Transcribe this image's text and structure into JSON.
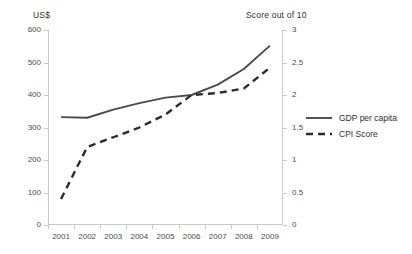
{
  "chart_data": {
    "type": "line",
    "title": "",
    "xlabel": "",
    "categories": [
      "2001",
      "2002",
      "2003",
      "2004",
      "2005",
      "2006",
      "2007",
      "2008",
      "2009"
    ],
    "axes": {
      "left": {
        "label": "US$",
        "ticks": [
          "0",
          "100",
          "200",
          "300",
          "400",
          "500",
          "600"
        ],
        "tick_values": [
          0,
          100,
          200,
          300,
          400,
          500,
          600
        ],
        "range": [
          0,
          600
        ]
      },
      "right": {
        "label": "Score out of 10",
        "ticks": [
          "0",
          "0.5",
          "1",
          "1.5",
          "2",
          "2.5",
          "3"
        ],
        "tick_values": [
          0,
          0.5,
          1,
          1.5,
          2,
          2.5,
          3
        ],
        "range": [
          0,
          3
        ]
      }
    },
    "grid": false,
    "legend_position": "right",
    "series": [
      {
        "name": "GDP per capita",
        "axis": "left",
        "style": "solid",
        "color": "#4a4a4a",
        "values": [
          332,
          330,
          355,
          375,
          392,
          400,
          432,
          480,
          552
        ]
      },
      {
        "name": "CPI Score",
        "axis": "right",
        "style": "dashed",
        "color": "#2b2b2b",
        "values": [
          0.4,
          1.2,
          1.35,
          1.5,
          1.7,
          2.0,
          2.03,
          2.1,
          2.42
        ]
      }
    ]
  },
  "legend": {
    "items": [
      {
        "label": "GDP per capita",
        "style": "solid"
      },
      {
        "label": "CPI Score",
        "style": "dashed"
      }
    ]
  }
}
